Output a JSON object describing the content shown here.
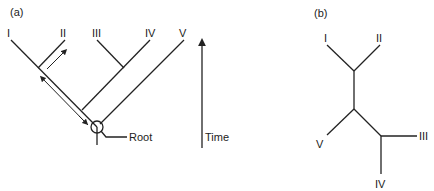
{
  "panel_a": {
    "label": "(a)",
    "taxa": [
      "I",
      "II",
      "III",
      "IV",
      "V"
    ],
    "root_label": "Root",
    "time_label": "Time"
  },
  "panel_b": {
    "label": "(b)",
    "taxa": [
      "I",
      "II",
      "III",
      "IV",
      "V"
    ]
  },
  "colors": {
    "line": "#222222",
    "background": "#ffffff"
  }
}
